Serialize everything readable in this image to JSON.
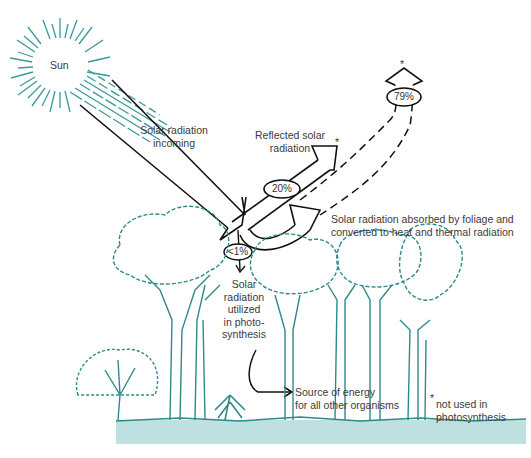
{
  "diagram": {
    "sun": {
      "label": "Sun"
    },
    "incoming": {
      "line1": "Solar radiation",
      "line2": "incoming"
    },
    "reflected": {
      "line1": "Reflected solar",
      "line2": "radiation",
      "percent": "20%",
      "asterisk": "*"
    },
    "absorbed": {
      "line1": "Solar radiation absorbed by foliage and",
      "line2": "converted to heat and thermal radiation",
      "percent": "79%",
      "asterisk": "*"
    },
    "photosynthesis": {
      "percent": "<1%",
      "line1": "Solar",
      "line2": "radiation",
      "line3": "utilized",
      "line4": "in photo-",
      "line5": "synthesis"
    },
    "energy_source": {
      "line1": "Source of energy",
      "line2": "for all other organisms"
    },
    "footnote": {
      "asterisk": "*",
      "line1": "not used in",
      "line2": "photosynthesis"
    },
    "colors": {
      "tree": "#2e8a8a",
      "ground": "#bfe0e0",
      "sunrays": "#3a9a9a",
      "arrows": "#111111"
    }
  }
}
